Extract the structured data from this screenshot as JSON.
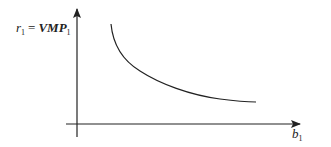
{
  "diagram": {
    "type": "economics-curve",
    "y_axis": {
      "label_lhs_var": "r",
      "label_lhs_sub": "1",
      "label_eq": "=",
      "label_rhs_var": "VMP",
      "label_rhs_sub": "1"
    },
    "x_axis": {
      "label_var": "b",
      "label_sub": "1"
    },
    "curve": {
      "shape": "downward-sloping convex",
      "points": [
        [
          111,
          24
        ],
        [
          125,
          55
        ],
        [
          150,
          75
        ],
        [
          180,
          87
        ],
        [
          215,
          98
        ],
        [
          256,
          102
        ]
      ]
    },
    "colors": {
      "line": "#222222",
      "background": "#ffffff"
    }
  }
}
